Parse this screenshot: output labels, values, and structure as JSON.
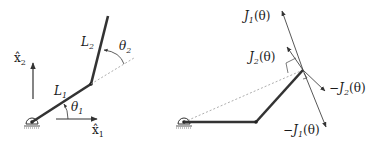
{
  "left_diagram": {
    "axis_x_label": "x̂",
    "axis_x_sub": "1",
    "axis_y_label": "x̂",
    "axis_y_sub": "2",
    "link1_label": "L",
    "link1_sub": "1",
    "link2_label": "L",
    "link2_sub": "2",
    "angle1_label": "θ",
    "angle1_sub": "1",
    "angle2_label": "θ",
    "angle2_sub": "2"
  },
  "right_diagram": {
    "j1_label": "J",
    "j1_sub": "1",
    "j1_arg": "(θ)",
    "j2_label": "J",
    "j2_sub": "2",
    "j2_arg": "(θ)",
    "neg_j1_prefix": "−J",
    "neg_j1_sub": "1",
    "neg_j1_arg": "(θ)",
    "neg_j2_prefix": "−J",
    "neg_j2_sub": "2",
    "neg_j2_arg": "(θ)"
  },
  "colors": {
    "link": "#333333",
    "line": "#444444",
    "dashed": "#999999"
  }
}
